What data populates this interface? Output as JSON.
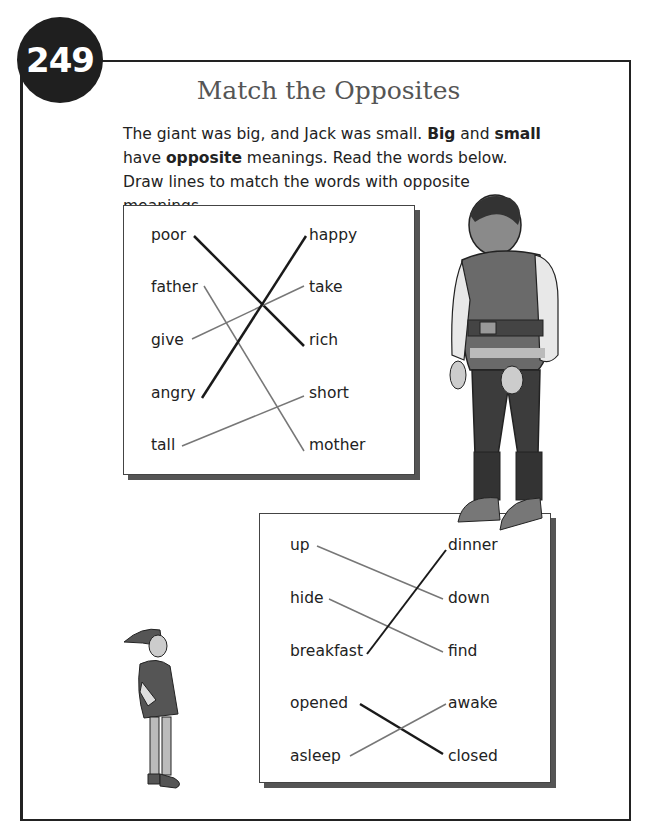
{
  "page": {
    "number": "249",
    "title": "Match the Opposites",
    "intro": {
      "s1": "The giant was big, and Jack was small. ",
      "b1": "Big",
      "s2": " and ",
      "b2": "small",
      "s3": " have ",
      "b3": "opposite",
      "s4": " meanings. Read the words below. Draw lines to match the words with  opposite meanings."
    }
  },
  "box1": {
    "left": [
      "poor",
      "father",
      "give",
      "angry",
      "tall"
    ],
    "right": [
      "happy",
      "take",
      "rich",
      "short",
      "mother"
    ],
    "matches": [
      [
        "poor",
        "rich"
      ],
      [
        "father",
        "mother"
      ],
      [
        "give",
        "take"
      ],
      [
        "angry",
        "happy"
      ],
      [
        "tall",
        "short"
      ]
    ]
  },
  "box2": {
    "left": [
      "up",
      "hide",
      "breakfast",
      "opened",
      "asleep"
    ],
    "right": [
      "dinner",
      "down",
      "find",
      "awake",
      "closed"
    ],
    "matches": [
      [
        "up",
        "down"
      ],
      [
        "hide",
        "find"
      ],
      [
        "breakfast",
        "dinner"
      ],
      [
        "opened",
        "closed"
      ],
      [
        "asleep",
        "awake"
      ]
    ]
  },
  "illustrations": {
    "giant": "giant-illustration",
    "jack": "jack-illustration"
  },
  "colors": {
    "badge": "#1f1f1f",
    "line_dark": "#1a1a1a",
    "line_light": "#777777",
    "shadow": "#555555"
  }
}
